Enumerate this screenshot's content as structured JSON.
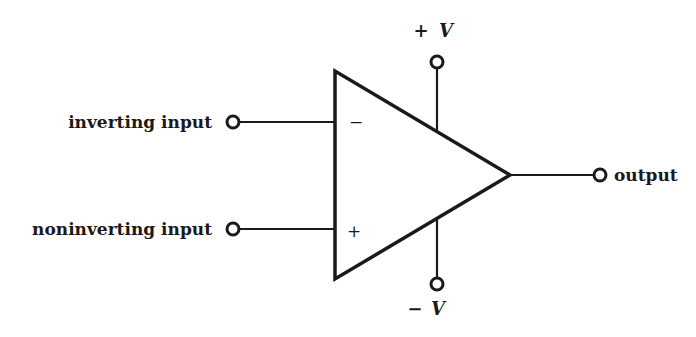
{
  "diagram": {
    "component": "op-amp",
    "colors": {
      "ink": "#1a1a1a",
      "background": "#ffffff"
    },
    "inputs": [
      {
        "label": "inverting input",
        "sign": "−"
      },
      {
        "label": "noninverting input",
        "sign": "+"
      }
    ],
    "output": {
      "label": "output"
    },
    "supplies": {
      "positive": {
        "sign": "+",
        "symbol": "V"
      },
      "negative": {
        "sign": "−",
        "symbol": "V"
      }
    }
  }
}
